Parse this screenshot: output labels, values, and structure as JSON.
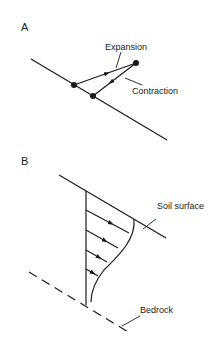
{
  "panel_a": {
    "label": "A",
    "expansion_label": "Expansion",
    "contraction_label": "Contraction"
  },
  "panel_b": {
    "label": "B",
    "soil_surface_label": "Soil surface",
    "bedrock_label": "Bedrock"
  },
  "colors": {
    "line": "#1a1a1a",
    "background": "#ffffff"
  }
}
